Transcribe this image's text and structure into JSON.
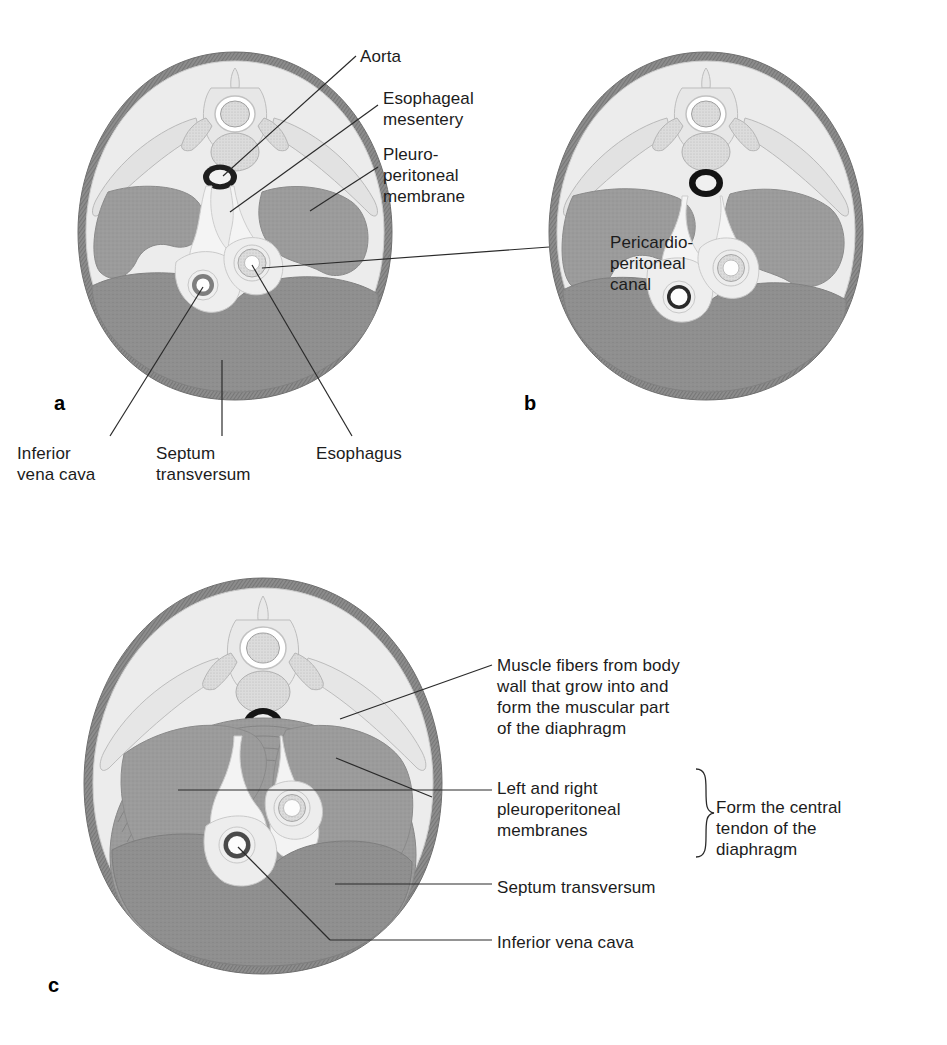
{
  "figure": {
    "panels": [
      {
        "letter": "a",
        "name": "early-stage"
      },
      {
        "letter": "b",
        "name": "intermediate-stage"
      },
      {
        "letter": "c",
        "name": "late-stage"
      }
    ]
  },
  "panel_a": {
    "letter": "a",
    "labels": {
      "aorta": "Aorta",
      "esophageal_mesentery": "Esophageal\nmesentery",
      "pleuroperitoneal_membrane": "Pleuro-\nperitoneal\nmembrane",
      "pericardioperitoneal_canal": "Pericardio-\nperitoneal\ncanal",
      "inferior_vena_cava": "Inferior\nvena cava",
      "septum_transversum": "Septum\ntransversum",
      "esophagus": "Esophagus"
    }
  },
  "panel_b": {
    "letter": "b",
    "labels": {}
  },
  "panel_c": {
    "letter": "c",
    "labels": {
      "muscle_fibers": "Muscle fibers from body\nwall that grow into and\nform the muscular part\nof the diaphragm",
      "pleuroperitoneal_membranes": "Left and right\npleuroperitoneal\nmembranes",
      "septum_transversum": "Septum transversum",
      "inferior_vena_cava": "Inferior vena cava",
      "brace_note": "Form the central\ntendon of the\ndiaphragm"
    }
  },
  "colors": {
    "background": "#ffffff",
    "body_wall_outer": "#8d8d8d",
    "body_wall_inner": "#e9e9e9",
    "cavity_light": "#efefef",
    "tissue_mid_gray": "#9b9b9b",
    "tissue_dark_gray": "#8f8f8f",
    "membrane_light": "#e3e3e3",
    "rib_gray": "#d6d6d6",
    "vertebra_fill": "#e0e0e0",
    "vertebra_stipple": "#b4b4b4",
    "aorta_ring": "#1f1f1f",
    "vessel_ring": "#6f6f6f",
    "lumen_white": "#ffffff",
    "leader_line": "#2a2a2a",
    "text": "#1c1c1c"
  }
}
